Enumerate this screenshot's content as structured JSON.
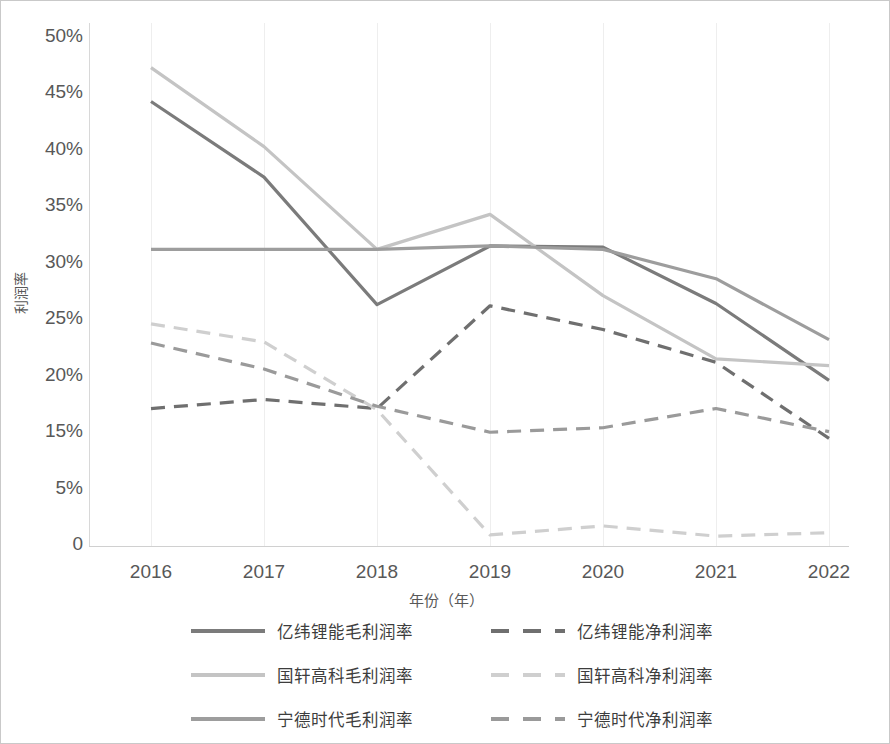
{
  "chart_data": {
    "type": "line",
    "title": "",
    "xlabel": "年份（年）",
    "ylabel": "利润率",
    "x": [
      2016,
      2017,
      2018,
      2019,
      2020,
      2021,
      2022
    ],
    "xtick_labels": [
      "2016",
      "2017",
      "2018",
      "2019",
      "2020",
      "2021",
      "2022"
    ],
    "ytick_labels": [
      "50%",
      "45%",
      "40%",
      "35%",
      "30%",
      "25%",
      "20%",
      "15%",
      "5%",
      "0"
    ],
    "ytick_values": [
      50,
      45,
      40,
      35,
      30,
      25,
      20,
      15,
      5,
      0
    ],
    "ylim": [
      0,
      50
    ],
    "yunit": "%",
    "grid": "vertical-only",
    "legend_position": "bottom",
    "note": "Y axis tick labels are evenly spaced but skip 10%, exactly as printed on the source figure.",
    "series": [
      {
        "name": "亿纬锂能毛利润率",
        "style": "solid",
        "color": "#7b7b7b",
        "values": [
          44.2,
          37.5,
          26.2,
          31.4,
          31.3,
          26.3,
          19.5
        ]
      },
      {
        "name": "亿纬锂能净利润率",
        "style": "dashed",
        "color": "#6f6f6f",
        "values": [
          17.0,
          17.8,
          17.0,
          26.1,
          24.0,
          21.1,
          13.7
        ]
      },
      {
        "name": "国轩高科毛利润率",
        "style": "solid",
        "color": "#c4c4c4",
        "values": [
          47.2,
          40.2,
          31.1,
          34.2,
          27.0,
          21.4,
          20.8
        ]
      },
      {
        "name": "国轩高科净利润率",
        "style": "dashed",
        "color": "#cfcfcf",
        "values": [
          24.5,
          22.9,
          16.9,
          0.8,
          1.6,
          0.7,
          1.0
        ]
      },
      {
        "name": "宁德时代毛利润率",
        "style": "solid",
        "color": "#9d9d9d",
        "values": [
          31.1,
          31.1,
          31.1,
          31.4,
          31.1,
          28.5,
          23.1
        ]
      },
      {
        "name": "宁德时代净利润率",
        "style": "dashed",
        "color": "#9a9a9a",
        "values": [
          22.8,
          20.5,
          17.2,
          14.8,
          15.3,
          17.0,
          14.9
        ]
      }
    ]
  },
  "legend": {
    "items": [
      {
        "label": "亿纬锂能毛利润率",
        "row": 0,
        "col": 0,
        "series": 0
      },
      {
        "label": "亿纬锂能净利润率",
        "row": 0,
        "col": 1,
        "series": 1
      },
      {
        "label": "国轩高科毛利润率",
        "row": 1,
        "col": 0,
        "series": 2
      },
      {
        "label": "国轩高科净利润率",
        "row": 1,
        "col": 1,
        "series": 3
      },
      {
        "label": "宁德时代毛利润率",
        "row": 2,
        "col": 0,
        "series": 4
      },
      {
        "label": "宁德时代净利润率",
        "row": 2,
        "col": 1,
        "series": 5
      }
    ]
  }
}
